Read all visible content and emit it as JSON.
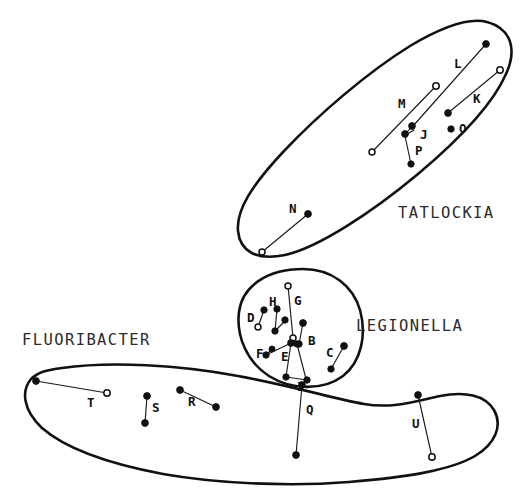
{
  "figure": {
    "background_color": "#ffffff",
    "ink_color": "#111111",
    "label_color": "#2b2b2b",
    "width": 529,
    "height": 498
  },
  "groups": [
    {
      "id": "tatlockia",
      "label": "TATLOCKIA",
      "label_x": 398,
      "label_y": 218,
      "outline": "M 487,22 C 511,28 517,46 508,70 C 497,100 466,134 420,172 C 372,212 318,247 285,255 C 256,262 240,252 238,232 C 236,211 251,186 283,152 C 318,115 368,72 410,46 C 442,27 468,18 487,22 Z"
    },
    {
      "id": "legionella",
      "label": "LEGIONELLA",
      "label_x": 356,
      "label_y": 331,
      "outline": "M 301,269 C 330,268 352,284 360,309 C 368,334 362,361 344,375 C 324,390 292,389 270,375 C 248,361 237,336 240,312 C 243,288 265,270 301,269 Z"
    },
    {
      "id": "fluoribacter",
      "label": "FLUORIBACTER",
      "label_x": 22,
      "label_y": 345,
      "outline": "M 64,369 C 110,362 178,365 235,375 C 291,385 330,397 363,403 C 392,409 416,401 440,396 C 465,391 484,394 493,409 C 502,425 496,443 476,455 C 452,469 410,476 350,481 C 286,486 216,483 165,474 C 112,465 68,450 44,429 C 24,411 22,391 32,379 C 40,371 50,371 64,369 Z"
    }
  ],
  "pairs": [
    {
      "id": "B",
      "group": "legionella",
      "label": "B",
      "label_x": 310,
      "label_y": 341,
      "x1": 303,
      "y1": 334,
      "y2": 323,
      "x2": 295,
      "from": [
        303,
        323
      ],
      "to": [
        292,
        343
      ]
    },
    {
      "id": "C",
      "group": "legionella",
      "label": "C",
      "label_x": 326,
      "label_y": 355,
      "from": [
        344,
        346
      ],
      "to": [
        331,
        369
      ]
    },
    {
      "id": "D",
      "group": "legionella",
      "label": "D",
      "label_x": 248,
      "label_y": 318,
      "from": [
        264,
        310
      ],
      "to": [
        259,
        326
      ]
    },
    {
      "id": "E",
      "group": "legionella",
      "label": "E",
      "label_x": 281,
      "label_y": 357,
      "from": [
        290,
        344
      ],
      "to": [
        286,
        377
      ]
    },
    {
      "id": "F",
      "group": "legionella",
      "label": "F",
      "label_x": 256,
      "label_y": 352,
      "from": [
        266,
        355
      ],
      "to": [
        291,
        343
      ]
    },
    {
      "id": "G",
      "group": "legionella",
      "label": "G",
      "label_x": 293,
      "label_y": 303,
      "from": [
        288,
        286
      ],
      "to": [
        293,
        338
      ]
    },
    {
      "id": "H",
      "group": "legionella",
      "label": "H",
      "label_x": 271,
      "label_y": 303,
      "from": [
        277,
        310
      ],
      "to": [
        276,
        330
      ]
    },
    {
      "id": "I",
      "group": "legionella",
      "label": "I",
      "label_x": 299,
      "label_y": 386,
      "from": [
        286,
        377
      ],
      "to": [
        307,
        380
      ]
    },
    {
      "id": "J",
      "group": "tatlockia",
      "label": "J",
      "label_x": 424,
      "label_y": 138,
      "from": [
        412,
        126
      ],
      "to": [
        405,
        134
      ]
    },
    {
      "id": "K",
      "group": "tatlockia",
      "label": "K",
      "label_x": 473,
      "label_y": 99,
      "from": [
        500,
        70
      ],
      "to": [
        448,
        113
      ]
    },
    {
      "id": "L",
      "group": "tatlockia",
      "label": "L",
      "label_x": 456,
      "label_y": 64,
      "from": [
        486,
        44
      ],
      "to": [
        413,
        126
      ]
    },
    {
      "id": "M",
      "group": "tatlockia",
      "label": "M",
      "label_x": 399,
      "label_y": 105,
      "from": [
        436,
        86
      ],
      "to": [
        372,
        152
      ]
    },
    {
      "id": "N",
      "group": "tatlockia",
      "label": "N",
      "label_x": 290,
      "label_y": 211,
      "from": [
        308,
        214
      ],
      "to": [
        262,
        252
      ]
    },
    {
      "id": "O",
      "group": "tatlockia",
      "label": "O",
      "label_x": 464,
      "label_y": 132,
      "from": [
        453,
        128
      ],
      "to": [
        453,
        128
      ]
    },
    {
      "id": "P",
      "group": "tatlockia",
      "label": "P",
      "label_x": 419,
      "label_y": 153,
      "from": [
        404,
        136
      ],
      "to": [
        411,
        164
      ]
    },
    {
      "id": "Q",
      "group": "fluoribacter",
      "label": "Q",
      "label_x": 308,
      "label_y": 412,
      "from": [
        302,
        385
      ],
      "to": [
        296,
        455
      ]
    },
    {
      "id": "R",
      "group": "fluoribacter",
      "label": "R",
      "label_x": 190,
      "label_y": 403,
      "from": [
        180,
        390
      ],
      "to": [
        216,
        407
      ]
    },
    {
      "id": "S",
      "group": "fluoribacter",
      "label": "S",
      "label_x": 153,
      "label_y": 410,
      "from": [
        147,
        396
      ],
      "to": [
        145,
        423
      ]
    },
    {
      "id": "T",
      "group": "fluoribacter",
      "label": "T",
      "label_x": 89,
      "label_y": 406,
      "from": [
        36,
        381
      ],
      "to": [
        107,
        393
      ]
    },
    {
      "id": "U",
      "group": "fluoribacter",
      "label": "U",
      "label_x": 414,
      "label_y": 426,
      "from": [
        418,
        395
      ],
      "to": [
        432,
        457
      ]
    }
  ],
  "extra_nodes": [
    {
      "id": "legionella-n1",
      "x": 297,
      "y": 330,
      "hollow": true
    },
    {
      "id": "legionella-n2",
      "x": 281,
      "y": 320,
      "hollow": false
    },
    {
      "id": "legionella-n3",
      "x": 286,
      "y": 327,
      "hollow": false
    },
    {
      "id": "legionella-n4",
      "x": 291,
      "y": 343,
      "hollow": false
    },
    {
      "id": "legionella-n5",
      "x": 307,
      "y": 380,
      "hollow": false
    },
    {
      "id": "tatlockia-n1",
      "x": 405,
      "y": 134,
      "hollow": false
    },
    {
      "id": "tatlockia-n2",
      "x": 412,
      "y": 126,
      "hollow": false
    }
  ],
  "caption": {
    "text": "",
    "visible": false
  }
}
